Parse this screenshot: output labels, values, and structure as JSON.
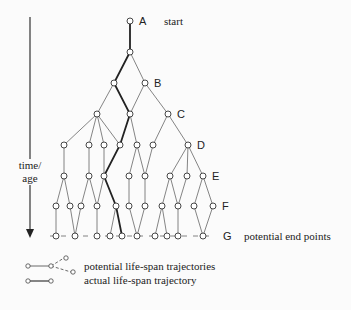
{
  "diagram": {
    "axis": {
      "label_line1": "time/",
      "label_line2": "age"
    },
    "levels": [
      {
        "id": "A",
        "label": "A",
        "y": 21
      },
      {
        "id": "B",
        "label": "B",
        "y": 83
      },
      {
        "id": "C",
        "label": "C",
        "y": 114
      },
      {
        "id": "D",
        "label": "D",
        "y": 145
      },
      {
        "id": "E",
        "label": "E",
        "y": 176
      },
      {
        "id": "F",
        "label": "F",
        "y": 206
      },
      {
        "id": "G",
        "label": "G",
        "y": 236
      }
    ],
    "annotations": {
      "start": "start",
      "end": "potential end points"
    },
    "legend": {
      "potential": "potential life-span trajectories",
      "actual": "actual life-span trajectory"
    },
    "colors": {
      "line": "#555555",
      "bold": "#222222",
      "node_fill": "#ffffff"
    }
  }
}
